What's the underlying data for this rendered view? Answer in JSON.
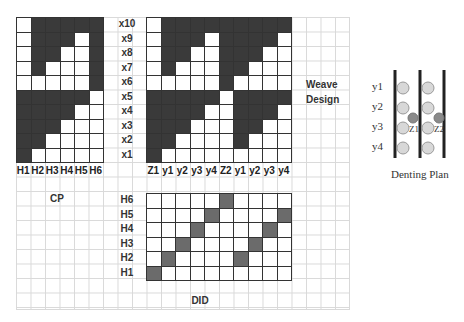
{
  "cp": {
    "title": "CP",
    "columns": [
      "H1",
      "H2",
      "H3",
      "H4",
      "H5",
      "H6"
    ],
    "rows": [
      [
        0,
        1,
        1,
        1,
        1,
        1
      ],
      [
        0,
        1,
        1,
        1,
        0,
        1
      ],
      [
        0,
        1,
        1,
        0,
        0,
        1
      ],
      [
        0,
        1,
        0,
        0,
        0,
        1
      ],
      [
        0,
        0,
        0,
        0,
        0,
        1
      ],
      [
        1,
        1,
        1,
        1,
        1,
        0
      ],
      [
        1,
        1,
        1,
        1,
        0,
        0
      ],
      [
        1,
        1,
        1,
        0,
        0,
        0
      ],
      [
        1,
        1,
        0,
        0,
        0,
        0
      ],
      [
        1,
        0,
        0,
        0,
        0,
        0
      ]
    ]
  },
  "row_labels": [
    "x10",
    "x9",
    "x8",
    "x7",
    "x6",
    "x5",
    "x4",
    "x3",
    "x2",
    "x1"
  ],
  "weave": {
    "title_line1": "Weave",
    "title_line2": "Design",
    "columns": [
      "Z1",
      "y1",
      "y2",
      "y3",
      "y4",
      "Z2",
      "y1",
      "y2",
      "y3",
      "y4"
    ],
    "rows": [
      [
        0,
        1,
        1,
        1,
        1,
        1,
        1,
        1,
        1,
        1
      ],
      [
        0,
        1,
        1,
        1,
        0,
        1,
        1,
        1,
        1,
        0
      ],
      [
        0,
        1,
        1,
        0,
        0,
        1,
        1,
        1,
        0,
        0
      ],
      [
        0,
        1,
        0,
        0,
        0,
        1,
        1,
        0,
        0,
        0
      ],
      [
        0,
        0,
        0,
        0,
        0,
        1,
        0,
        0,
        0,
        0
      ],
      [
        1,
        1,
        1,
        1,
        1,
        0,
        1,
        1,
        1,
        1
      ],
      [
        1,
        1,
        1,
        1,
        0,
        0,
        1,
        1,
        1,
        0
      ],
      [
        1,
        1,
        1,
        0,
        0,
        0,
        1,
        1,
        0,
        0
      ],
      [
        1,
        1,
        0,
        0,
        0,
        0,
        1,
        0,
        0,
        0
      ],
      [
        1,
        0,
        0,
        0,
        0,
        0,
        0,
        0,
        0,
        0
      ]
    ]
  },
  "did": {
    "title": "DID",
    "row_labels": [
      "H6",
      "H5",
      "H4",
      "H3",
      "H2",
      "H1"
    ],
    "rows": [
      [
        0,
        0,
        0,
        0,
        0,
        1,
        0,
        0,
        0,
        0
      ],
      [
        0,
        0,
        0,
        0,
        1,
        0,
        0,
        0,
        0,
        1
      ],
      [
        0,
        0,
        0,
        1,
        0,
        0,
        0,
        0,
        1,
        0
      ],
      [
        0,
        0,
        1,
        0,
        0,
        0,
        0,
        1,
        0,
        0
      ],
      [
        0,
        1,
        0,
        0,
        0,
        0,
        1,
        0,
        0,
        0
      ],
      [
        1,
        0,
        0,
        0,
        0,
        0,
        0,
        0,
        0,
        0
      ]
    ]
  },
  "denting_plan": {
    "title": "Denting Plan",
    "y_labels": [
      "y1",
      "y2",
      "y3",
      "y4"
    ],
    "z_labels": [
      "Z1",
      "Z2"
    ]
  },
  "colors": {
    "filled": "#3a3a3a",
    "did_filled": "#6b6b6b",
    "circle_light": "#d8d8d8",
    "circle_dark": "#8a8a8a"
  }
}
